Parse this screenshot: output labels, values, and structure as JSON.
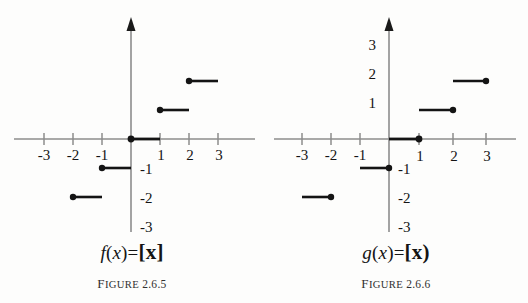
{
  "figures": [
    {
      "id": "figure-2-6-5",
      "caption_word": "Figure",
      "caption_number": "2.6.5",
      "function_label": {
        "name": "f",
        "arg_open": "(",
        "arg": "x",
        "arg_close": ")",
        "equals": "=",
        "bracket_open": "[",
        "bracket_var": "x",
        "bracket_close": "]",
        "full": "f(x)=[x]"
      },
      "x_tick_labels": [
        "-3",
        "-2",
        "-1",
        "1",
        "2",
        "3"
      ],
      "y_tick_labels": [
        "-1",
        "-2",
        "-3"
      ],
      "chart_data": {
        "type": "line",
        "title": "f(x)=[x]",
        "xlabel": "x",
        "ylabel": "y",
        "xlim": [
          -3.6,
          3.6
        ],
        "ylim": [
          -3.6,
          3.6
        ],
        "grid": false,
        "legend": "none",
        "function_kind": "floor",
        "closed_endpoint": "left",
        "segments": [
          {
            "x_start": -2,
            "x_end": -1,
            "y": -2,
            "closed_at": "left",
            "open_at": "right"
          },
          {
            "x_start": -1,
            "x_end": 0,
            "y": -1,
            "closed_at": "left",
            "open_at": "right"
          },
          {
            "x_start": 0,
            "x_end": 1,
            "y": 0,
            "closed_at": "left",
            "open_at": "right"
          },
          {
            "x_start": 1,
            "x_end": 2,
            "y": 1,
            "closed_at": "left",
            "open_at": "right"
          },
          {
            "x_start": 2,
            "x_end": 3,
            "y": 2,
            "closed_at": "left",
            "open_at": "right"
          }
        ]
      }
    },
    {
      "id": "figure-2-6-6",
      "caption_word": "Figure",
      "caption_number": "2.6.6",
      "function_label": {
        "name": "g",
        "arg_open": "(",
        "arg": "x",
        "arg_close": ")",
        "equals": "=",
        "bracket_open": "[",
        "bracket_var": "x",
        "bracket_close": ")",
        "full": "g(x)=[x)"
      },
      "x_tick_labels": [
        "-3",
        "-2",
        "-1",
        "1",
        "2",
        "3"
      ],
      "y_tick_labels": [
        "3",
        "2",
        "1",
        "-1",
        "-2",
        "-3"
      ],
      "chart_data": {
        "type": "line",
        "title": "g(x)=[x)",
        "xlabel": "x",
        "ylabel": "y",
        "xlim": [
          -3.6,
          3.6
        ],
        "ylim": [
          -3.6,
          3.6
        ],
        "grid": false,
        "legend": "none",
        "function_kind": "ceiling",
        "closed_endpoint": "right",
        "segments": [
          {
            "x_start": -3,
            "x_end": -2,
            "y": -2,
            "closed_at": "right",
            "open_at": "left"
          },
          {
            "x_start": -2,
            "x_end": -1,
            "y": -1,
            "closed_at": "right",
            "open_at": "left"
          },
          {
            "x_start": -1,
            "x_end": 0,
            "y": 0,
            "closed_at": "right",
            "open_at": "left"
          },
          {
            "x_start": 0,
            "x_end": 1,
            "y": 1,
            "closed_at": "right",
            "open_at": "left"
          },
          {
            "x_start": 1,
            "x_end": 2,
            "y": 2,
            "closed_at": "right",
            "open_at": "left"
          }
        ]
      }
    }
  ],
  "colors": {
    "ink": "#141414",
    "axis": "#8c8c8c",
    "background": "#fdfdfc",
    "caption": "#303030"
  }
}
